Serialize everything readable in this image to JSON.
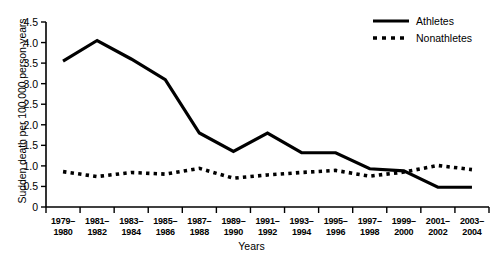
{
  "chart_data": {
    "type": "line",
    "title": "",
    "xlabel": "Years",
    "ylabel": "Sudden death per 100,000 person-years",
    "categories": [
      "1979–1980",
      "1981–1982",
      "1983–1984",
      "1985–1986",
      "1987–1988",
      "1989–1990",
      "1991–1992",
      "1993–1994",
      "1995–1996",
      "1997–1998",
      "1999–2000",
      "2001–2002",
      "2003–2004"
    ],
    "categories_line1": [
      "1979–",
      "1981–",
      "1983–",
      "1985–",
      "1987–",
      "1989–",
      "1991–",
      "1993–",
      "1995–",
      "1997–",
      "1999–",
      "2001–",
      "2003–"
    ],
    "categories_line2": [
      "1980",
      "1982",
      "1984",
      "1986",
      "1988",
      "1990",
      "1992",
      "1994",
      "1996",
      "1998",
      "2000",
      "2002",
      "2004"
    ],
    "series": [
      {
        "name": "Athletes",
        "style": "solid",
        "color": "#000000",
        "values": [
          3.55,
          4.05,
          3.6,
          3.1,
          1.8,
          1.35,
          1.8,
          1.32,
          1.32,
          0.93,
          0.88,
          0.48,
          0.48
        ]
      },
      {
        "name": "Nonathletes",
        "style": "dotted",
        "color": "#000000",
        "values": [
          0.86,
          0.74,
          0.84,
          0.8,
          0.94,
          0.7,
          0.78,
          0.84,
          0.89,
          0.75,
          0.85,
          1.01,
          0.91
        ]
      }
    ],
    "ylim": [
      0,
      4.5
    ],
    "yticks": [
      "0",
      "0.5",
      "1.0",
      "1.5",
      "2.0",
      "2.5",
      "3.0",
      "3.5",
      "4.0",
      "4.5"
    ],
    "ytick_values": [
      0,
      0.5,
      1.0,
      1.5,
      2.0,
      2.5,
      3.0,
      3.5,
      4.0,
      4.5
    ],
    "grid": false,
    "legend_position": "top-right",
    "legend": [
      {
        "label": "Athletes",
        "style": "solid"
      },
      {
        "label": "Nonathletes",
        "style": "dotted"
      }
    ]
  }
}
